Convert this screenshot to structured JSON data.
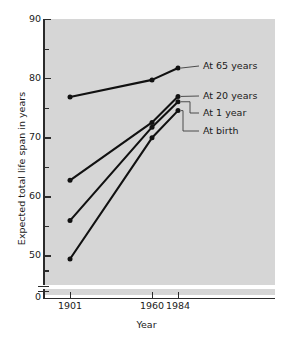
{
  "chart_data": {
    "type": "line",
    "title": "",
    "xlabel": "Year",
    "ylabel": "Expected total life span in years",
    "x": [
      1901,
      1960,
      1984
    ],
    "xticklabels": [
      "1901",
      "1960",
      "1984"
    ],
    "ylim": [
      45,
      90
    ],
    "yticks": [
      50,
      60,
      70,
      80,
      90
    ],
    "yticklabels": [
      "50",
      "60",
      "70",
      "80",
      "90"
    ],
    "y_minor_ticks": [
      47.5,
      55,
      65,
      75,
      85
    ],
    "y_axis_break": true,
    "y_origin_label": "0",
    "grid": false,
    "legend_position": "inline-right-annotations",
    "background": "#d6d6d6",
    "line_color": "#111111",
    "series": [
      {
        "name": "At 65 years",
        "values": [
          76.8,
          79.7,
          81.7
        ]
      },
      {
        "name": "At 20 years",
        "values": [
          62.7,
          72.5,
          76.9
        ]
      },
      {
        "name": "At 1 year",
        "values": [
          55.9,
          71.7,
          76.0
        ]
      },
      {
        "name": "At birth",
        "values": [
          49.4,
          69.9,
          74.5
        ]
      }
    ],
    "annotations": [
      {
        "label": "At 65 years",
        "series": "At 65 years"
      },
      {
        "label": "At 20 years",
        "series": "At 20 years"
      },
      {
        "label": "At 1 year",
        "series": "At 1 year"
      },
      {
        "label": "At birth",
        "series": "At birth"
      }
    ]
  }
}
